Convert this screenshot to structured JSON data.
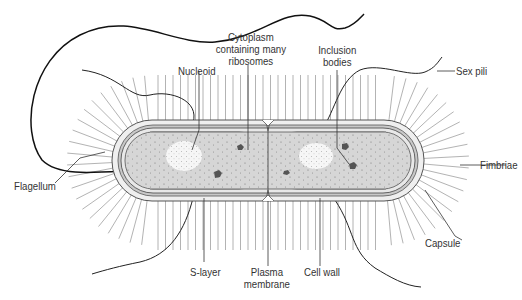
{
  "diagram": {
    "type": "labeled-illustration",
    "labels": [
      {
        "id": "nucleoid",
        "text": "Nucleoid"
      },
      {
        "id": "cytoplasm",
        "line1": "Cytoplasm",
        "line2": "containing many",
        "line3": "ribosomes"
      },
      {
        "id": "inclusion",
        "line1": "Inclusion",
        "line2": "bodies"
      },
      {
        "id": "sexpili",
        "text": "Sex pili"
      },
      {
        "id": "flagellum",
        "text": "Flagellum"
      },
      {
        "id": "fimbriae",
        "text": "Fimbriae"
      },
      {
        "id": "capsule",
        "text": "Capsule"
      },
      {
        "id": "slayer",
        "text": "S-layer"
      },
      {
        "id": "plasma",
        "line1": "Plasma",
        "line2": "membrane"
      },
      {
        "id": "cellwall",
        "text": "Cell wall"
      }
    ],
    "colors": {
      "cytoplasm": "#d4d4d4",
      "nucleoid": "#f4f4f4",
      "capsule": "#ececec",
      "line": "#222222",
      "fimbriae": "#9a9a9a"
    }
  }
}
